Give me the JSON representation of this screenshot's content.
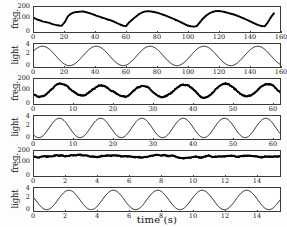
{
  "figure": {
    "xaxis_label": "time (s)",
    "background": "#ffffff",
    "line_color": "#000000",
    "axis_color": "#3a3a3a"
  },
  "chart_data": [
    {
      "type": "line",
      "panel_id": "freq-panel-1",
      "title": "",
      "ylabel": "freq.",
      "xlabel": "",
      "xlim": [
        0,
        160
      ],
      "ylim": [
        0,
        240
      ],
      "yticks": [
        0,
        100,
        200
      ],
      "ytick_labels": [
        "0",
        "100",
        "200"
      ],
      "xticks": [
        0,
        20,
        40,
        60,
        80,
        100,
        120,
        140,
        160
      ],
      "xtick_labels": [
        "0",
        "20",
        "40",
        "60",
        "80",
        "100",
        "120",
        "140",
        "160"
      ],
      "grid": false,
      "legend": "none",
      "series": [
        {
          "name": "firing frequency",
          "thick": true,
          "x": [
            0,
            2,
            4,
            6,
            8,
            10,
            12,
            14,
            16,
            18,
            20,
            22,
            24,
            26,
            28,
            30,
            32,
            34,
            36,
            38,
            40,
            42,
            44,
            46,
            48,
            50,
            52,
            54,
            56,
            58,
            60,
            62,
            64,
            66,
            68,
            70,
            72,
            74,
            76,
            78,
            80,
            82,
            84,
            86,
            88,
            90,
            92,
            94,
            96,
            98,
            100,
            102,
            104,
            106,
            108,
            110,
            112,
            114,
            116,
            118,
            120,
            122,
            124,
            126,
            128,
            130,
            132,
            134,
            136,
            138,
            140,
            142,
            144,
            146,
            148,
            150,
            152,
            154,
            156
          ],
          "y": [
            135,
            120,
            112,
            100,
            95,
            88,
            75,
            68,
            62,
            60,
            95,
            150,
            175,
            188,
            192,
            196,
            198,
            190,
            182,
            172,
            160,
            150,
            140,
            130,
            120,
            112,
            100,
            85,
            72,
            60,
            58,
            95,
            120,
            145,
            168,
            185,
            196,
            200,
            198,
            192,
            186,
            176,
            166,
            154,
            142,
            130,
            118,
            104,
            90,
            76,
            62,
            55,
            52,
            58,
            95,
            130,
            158,
            178,
            192,
            200,
            202,
            198,
            192,
            184,
            176,
            168,
            158,
            146,
            134,
            120,
            106,
            92,
            78,
            66,
            58,
            55,
            90,
            140,
            178
          ]
        }
      ]
    },
    {
      "type": "line",
      "panel_id": "light-panel-1",
      "title": "",
      "ylabel": "light",
      "xlabel": "",
      "xlim": [
        0,
        160
      ],
      "ylim": [
        -0.3,
        4.8
      ],
      "yticks": [
        0,
        2,
        4
      ],
      "ytick_labels": [
        "0",
        "2",
        "4"
      ],
      "xticks": [
        0,
        20,
        40,
        60,
        80,
        100,
        120,
        140,
        160
      ],
      "xtick_labels": [
        "0",
        "20",
        "40",
        "60",
        "80",
        "100",
        "120",
        "140",
        "160"
      ],
      "grid": false,
      "legend": "none",
      "series": [
        {
          "name": "light stimulus",
          "thick": false,
          "waveform": "raised-cosine",
          "period": 35,
          "phase_offset": 23,
          "amplitude_min": 0,
          "amplitude_max": 4.3
        }
      ]
    },
    {
      "type": "line",
      "panel_id": "freq-panel-2",
      "title": "",
      "ylabel": "freq.",
      "xlabel": "",
      "xlim": [
        0,
        62
      ],
      "ylim": [
        0,
        240
      ],
      "yticks": [
        0,
        100,
        200
      ],
      "ytick_labels": [
        "0",
        "100",
        "200"
      ],
      "xticks": [
        0,
        10,
        20,
        30,
        40,
        50,
        60
      ],
      "xtick_labels": [
        "0",
        "10",
        "20",
        "30",
        "40",
        "50",
        "60"
      ],
      "grid": false,
      "legend": "none",
      "series": [
        {
          "name": "firing frequency",
          "thick": true,
          "waveform": "noisy-raised-cosine",
          "period": 10.4,
          "phase_offset": 1.5,
          "amplitude_min": 70,
          "amplitude_max": 185
        }
      ]
    },
    {
      "type": "line",
      "panel_id": "light-panel-2",
      "title": "",
      "ylabel": "light",
      "xlabel": "",
      "xlim": [
        0,
        62
      ],
      "ylim": [
        -0.3,
        4.8
      ],
      "yticks": [
        0,
        2,
        4
      ],
      "ytick_labels": [
        "0",
        "2",
        "4"
      ],
      "xticks": [
        0,
        10,
        20,
        30,
        40,
        50,
        60
      ],
      "xtick_labels": [
        "0",
        "10",
        "20",
        "30",
        "40",
        "50",
        "60"
      ],
      "grid": false,
      "legend": "none",
      "series": [
        {
          "name": "light stimulus",
          "thick": false,
          "waveform": "raised-cosine",
          "period": 10.4,
          "phase_offset": 1.2,
          "amplitude_min": 0,
          "amplitude_max": 4.3
        }
      ]
    },
    {
      "type": "line",
      "panel_id": "freq-panel-3",
      "title": "",
      "ylabel": "freq.",
      "xlabel": "",
      "xlim": [
        0,
        15.5
      ],
      "ylim": [
        0,
        240
      ],
      "yticks": [
        0,
        100,
        200
      ],
      "ytick_labels": [
        "0",
        "100",
        "200"
      ],
      "xticks": [
        0,
        2,
        4,
        6,
        8,
        10,
        12,
        14
      ],
      "xtick_labels": [
        "0",
        "2",
        "4",
        "6",
        "8",
        "10",
        "12",
        "14"
      ],
      "grid": false,
      "legend": "none",
      "series": [
        {
          "name": "firing frequency",
          "thick": true,
          "waveform": "noisy-flat",
          "period": 2.8,
          "phase_offset": 0.8,
          "amplitude_min": 168,
          "amplitude_max": 195
        }
      ]
    },
    {
      "type": "line",
      "panel_id": "light-panel-3",
      "title": "",
      "ylabel": "light",
      "xlabel": "time (s)",
      "xlim": [
        0,
        15.5
      ],
      "ylim": [
        -0.3,
        4.8
      ],
      "yticks": [
        0,
        2,
        4
      ],
      "ytick_labels": [
        "0",
        "2",
        "4"
      ],
      "xticks": [
        0,
        2,
        4,
        6,
        8,
        10,
        12,
        14
      ],
      "xtick_labels": [
        "0",
        "2",
        "4",
        "6",
        "8",
        "10",
        "12",
        "14"
      ],
      "grid": false,
      "legend": "none",
      "series": [
        {
          "name": "light stimulus",
          "thick": false,
          "waveform": "raised-cosine",
          "period": 2.8,
          "phase_offset": 0.8,
          "amplitude_min": 0,
          "amplitude_max": 4.3
        }
      ]
    }
  ],
  "panels": [
    {
      "ylabel": "freq.",
      "yticks": [
        "200",
        "100",
        "0"
      ],
      "xticks": [
        "0",
        "20",
        "40",
        "60",
        "80",
        "100",
        "120",
        "140",
        "160"
      ]
    },
    {
      "ylabel": "light",
      "yticks": [
        "4",
        "2",
        "0"
      ],
      "xticks": [
        "0",
        "20",
        "40",
        "60",
        "80",
        "100",
        "120",
        "140",
        "160"
      ]
    },
    {
      "ylabel": "freq.",
      "yticks": [
        "200",
        "100",
        "0"
      ],
      "xticks": [
        "0",
        "10",
        "20",
        "30",
        "40",
        "50",
        "60"
      ]
    },
    {
      "ylabel": "light",
      "yticks": [
        "4",
        "2",
        "0"
      ],
      "xticks": [
        "0",
        "10",
        "20",
        "30",
        "40",
        "50",
        "60"
      ]
    },
    {
      "ylabel": "freq.",
      "yticks": [
        "200",
        "100",
        "0"
      ],
      "xticks": [
        "0",
        "2",
        "4",
        "6",
        "8",
        "10",
        "12",
        "14"
      ]
    },
    {
      "ylabel": "light",
      "yticks": [
        "4",
        "2",
        "0"
      ],
      "xticks": [
        "0",
        "2",
        "4",
        "6",
        "8",
        "10",
        "12",
        "14"
      ]
    }
  ]
}
